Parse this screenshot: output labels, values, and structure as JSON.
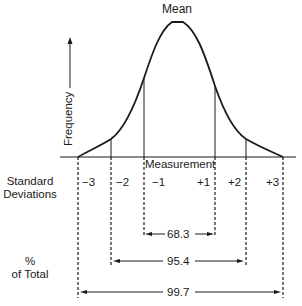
{
  "diagram": {
    "title_label": "Mean",
    "y_axis_label": "Frequency",
    "x_axis_label": "Measurement",
    "row_labels": {
      "standard_deviations": [
        "Standard",
        "Deviations"
      ],
      "percent_of_total": [
        "%",
        "of Total"
      ]
    },
    "sd_ticks": [
      "−3",
      "−2",
      "−1",
      "+1",
      "+2",
      "+3"
    ],
    "ranges": [
      {
        "label": "68.3",
        "from": "−1",
        "to": "+1"
      },
      {
        "label": "95.4",
        "from": "−2",
        "to": "+2"
      },
      {
        "label": "99.7",
        "from": "−3",
        "to": "+3"
      }
    ],
    "colors": {
      "ink": "#1a1a1a",
      "background": "#ffffff"
    }
  }
}
